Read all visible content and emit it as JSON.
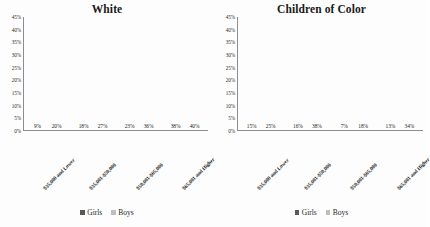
{
  "chart_data": [
    {
      "type": "bar",
      "title": "White",
      "xlabel": "",
      "ylabel": "",
      "ylim": [
        0,
        45
      ],
      "ytick_step": 5,
      "ytick_labels": [
        "45%",
        "40%",
        "35%",
        "30%",
        "25%",
        "20%",
        "15%",
        "10%",
        "5%",
        "0%"
      ],
      "grid": false,
      "legend_position": "bottom",
      "categories": [
        "$35,000 and Lower",
        "$35,001-$50,000",
        "$50,001-$65,000",
        "$65,001 and Higher"
      ],
      "series": [
        {
          "name": "Girls",
          "color": "#595959",
          "values": [
            9,
            18,
            23,
            38
          ],
          "labels": [
            "9%",
            "18%",
            "23%",
            "38%"
          ]
        },
        {
          "name": "Boys",
          "color": "#bfbfbf",
          "values": [
            20,
            27,
            36,
            40
          ],
          "labels": [
            "20%",
            "27%",
            "36%",
            "40%"
          ]
        }
      ]
    },
    {
      "type": "bar",
      "title": "Children of Color",
      "xlabel": "",
      "ylabel": "",
      "ylim": [
        0,
        45
      ],
      "ytick_step": 5,
      "ytick_labels": [
        "45%",
        "40%",
        "35%",
        "30%",
        "25%",
        "20%",
        "15%",
        "10%",
        "5%",
        "0%"
      ],
      "grid": false,
      "legend_position": "bottom",
      "categories": [
        "$35,000 and Lower",
        "$35,001-$50,000",
        "$50,001-$65,000",
        "$65,001 and Higher"
      ],
      "series": [
        {
          "name": "Girls",
          "color": "#595959",
          "values": [
            15,
            16,
            7,
            13
          ],
          "labels": [
            "15%",
            "16%",
            "7%",
            "13%"
          ]
        },
        {
          "name": "Boys",
          "color": "#bfbfbf",
          "values": [
            25,
            38,
            18,
            34
          ],
          "labels": [
            "25%",
            "38%",
            "18%",
            "34%"
          ]
        }
      ]
    }
  ]
}
